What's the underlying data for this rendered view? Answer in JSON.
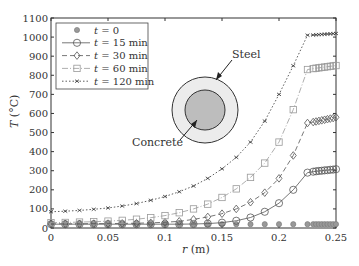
{
  "chart_data": {
    "type": "line",
    "title": "",
    "xlabel": "r (m)",
    "ylabel": "T (°C)",
    "xlim": [
      0,
      0.25
    ],
    "ylim": [
      0,
      1100
    ],
    "xticks": [
      "0",
      "0.05",
      "0.1",
      "0.15",
      "0.2",
      "0.25"
    ],
    "yticks": [
      "0",
      "100",
      "200",
      "300",
      "400",
      "500",
      "600",
      "700",
      "800",
      "900",
      "1000",
      "1100"
    ],
    "grid": false,
    "legend_position": "upper-left",
    "x": [
      0,
      0.0125,
      0.025,
      0.0375,
      0.05,
      0.0625,
      0.075,
      0.0875,
      0.1,
      0.1125,
      0.125,
      0.1375,
      0.15,
      0.1625,
      0.175,
      0.1875,
      0.2,
      0.2125,
      0.225
    ],
    "steel_x": [
      0.23,
      0.2325,
      0.235,
      0.2375,
      0.24,
      0.2425,
      0.245,
      0.2475,
      0.25
    ],
    "series": [
      {
        "name": "t = 0",
        "marker": "filled-circle",
        "line": "none",
        "values": [
          20,
          20,
          20,
          20,
          20,
          20,
          20,
          20,
          20,
          20,
          20,
          20,
          20,
          20,
          20,
          20,
          20,
          20,
          20
        ],
        "steel_values": [
          20,
          20,
          20,
          20,
          20,
          20,
          20,
          20,
          20
        ]
      },
      {
        "name": "t = 15 min",
        "marker": "circle",
        "line": "solid",
        "values": [
          20,
          20,
          20,
          20,
          20,
          20,
          20,
          20,
          20,
          20,
          21,
          23,
          28,
          38,
          55,
          85,
          130,
          200,
          290
        ],
        "steel_values": [
          295,
          297,
          299,
          300,
          302,
          303,
          305,
          306,
          308
        ]
      },
      {
        "name": "t = 30 min",
        "marker": "diamond",
        "line": "dashed",
        "values": [
          22,
          22,
          22,
          23,
          23,
          24,
          25,
          27,
          30,
          35,
          45,
          58,
          75,
          100,
          135,
          185,
          260,
          380,
          550
        ],
        "steel_values": [
          555,
          558,
          561,
          564,
          567,
          570,
          573,
          576,
          580
        ]
      },
      {
        "name": "t = 60 min",
        "marker": "square",
        "line": "dash-dot",
        "values": [
          28,
          29,
          31,
          33,
          36,
          40,
          46,
          54,
          65,
          80,
          100,
          125,
          160,
          205,
          265,
          340,
          450,
          620,
          830
        ],
        "steel_values": [
          835,
          837,
          839,
          841,
          843,
          845,
          847,
          849,
          851
        ]
      },
      {
        "name": "t = 120 min",
        "marker": "x",
        "line": "dotted",
        "values": [
          85,
          88,
          92,
          98,
          105,
          115,
          128,
          145,
          165,
          190,
          220,
          260,
          310,
          370,
          450,
          560,
          700,
          850,
          1010
        ],
        "steel_values": [
          1011,
          1012,
          1013,
          1014,
          1015,
          1016,
          1017,
          1018,
          1019
        ]
      }
    ],
    "annotations": [
      "Steel",
      "Concrete"
    ]
  },
  "labels": {
    "xlabel_var": "r",
    "xlabel_unit": " (m)",
    "ylabel_var": "T",
    "ylabel_unit": " (°C)",
    "steel": "Steel",
    "concrete": "Concrete",
    "legend": [
      "= 0",
      "= 15 min",
      "= 30 min",
      "= 60 min",
      "= 120 min"
    ],
    "legend_var": "t"
  }
}
